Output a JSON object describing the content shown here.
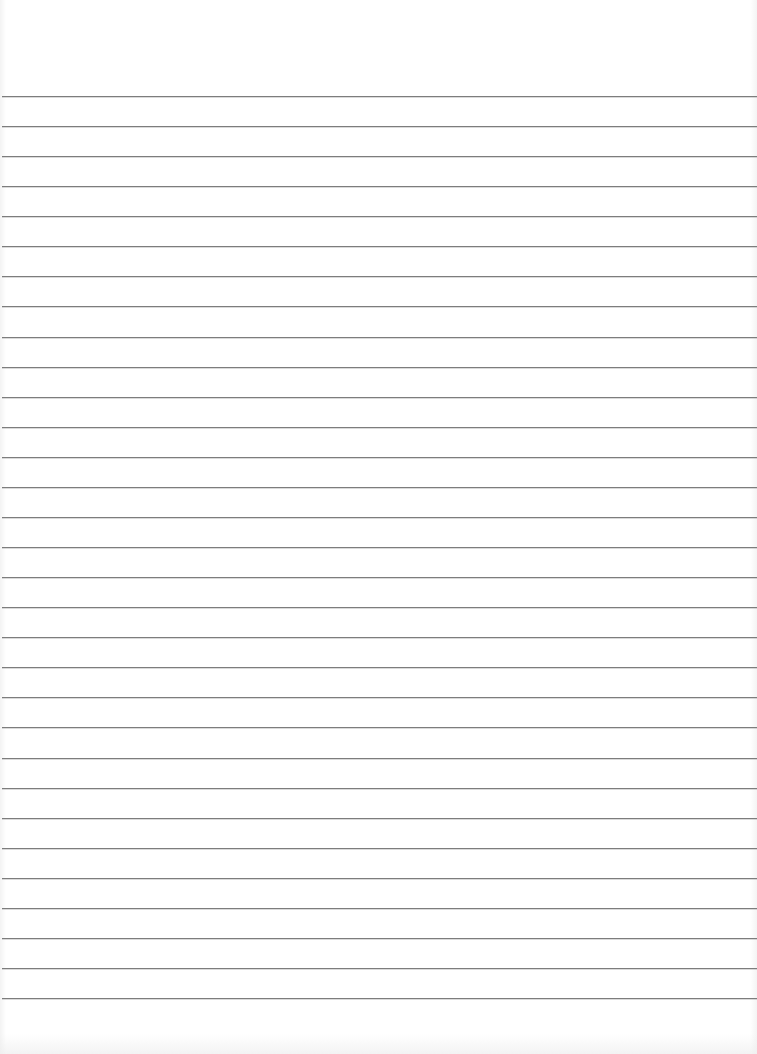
{
  "document": {
    "type": "lined-paper",
    "background_color": "#ffffff",
    "rule_color": "#7d7d7d",
    "first_rule_y": 96,
    "rule_spacing": 30.07,
    "rule_count": 31,
    "text_content": ""
  }
}
